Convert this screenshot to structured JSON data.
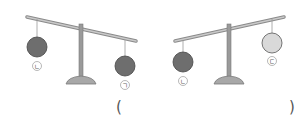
{
  "scales": [
    {
      "id": "left",
      "left_ball": {
        "label": "ㄴ",
        "shade": "dark",
        "color": "#6e6e6e"
      },
      "right_ball": {
        "label": "ㄱ",
        "shade": "dark",
        "color": "#6e6e6e"
      },
      "tilt": "right side down"
    },
    {
      "id": "right",
      "left_ball": {
        "label": "ㄴ",
        "shade": "dark",
        "color": "#6e6e6e"
      },
      "right_ball": {
        "label": "ㄷ",
        "shade": "light",
        "color": "#d9d9d9"
      },
      "tilt": "left side down"
    }
  ],
  "answer": {
    "open": "(",
    "close": ")",
    "value": ""
  }
}
